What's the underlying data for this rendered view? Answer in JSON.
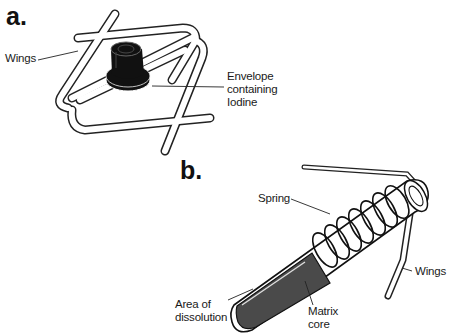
{
  "panels": [
    {
      "letter": "a.",
      "labels": {
        "wings": "Wings",
        "envelope_line1": "Envelope",
        "envelope_line2": "containing",
        "envelope_line3": "Iodine"
      }
    },
    {
      "letter": "b.",
      "labels": {
        "spring": "Spring",
        "wings": "Wings",
        "area_line1": "Area of",
        "area_line2": "dissolution",
        "matrix_line1": "Matrix",
        "matrix_line2": "core"
      }
    }
  ],
  "colors": {
    "ink": "#111111",
    "core_fill": "#4a4a4a",
    "background": "#ffffff"
  }
}
